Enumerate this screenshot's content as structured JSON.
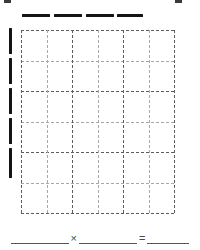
{
  "page": {
    "background_color": "#ffffff",
    "width": 200,
    "height": 250
  },
  "crop_marks": {
    "name": "page-crop-marks",
    "color": "#3a3a3a",
    "marks": [
      {
        "id": "top-left",
        "x": 4,
        "y": 0,
        "w": 7,
        "h": 3
      },
      {
        "id": "top-right",
        "x": 175,
        "y": 0,
        "w": 7,
        "h": 3
      }
    ]
  },
  "column_markers": {
    "name": "column-bars",
    "color": "#141414",
    "count": 4,
    "bar_height": 3,
    "y": 14,
    "bars": [
      {
        "id": "col-bar-1",
        "x": 22,
        "w": 28
      },
      {
        "id": "col-bar-2",
        "x": 54,
        "w": 28
      },
      {
        "id": "col-bar-3",
        "x": 86,
        "w": 28
      },
      {
        "id": "col-bar-4",
        "x": 117,
        "w": 26
      }
    ]
  },
  "row_markers": {
    "name": "row-bars",
    "color": "#141414",
    "count": 5,
    "bar_width": 3,
    "x": 9,
    "bars": [
      {
        "id": "row-bar-1",
        "y": 28,
        "h": 26
      },
      {
        "id": "row-bar-2",
        "y": 58,
        "h": 26
      },
      {
        "id": "row-bar-3",
        "y": 88,
        "h": 26
      },
      {
        "id": "row-bar-4",
        "y": 118,
        "h": 26
      },
      {
        "id": "row-bar-5",
        "y": 148,
        "h": 30
      }
    ]
  },
  "grid": {
    "name": "dashed-array-grid",
    "x": 21,
    "y": 30,
    "width": 153,
    "height": 183,
    "columns": 6,
    "rows": 6,
    "minor_color": "#a8a8a8",
    "major_color": "#5c5c5c",
    "dash_style": "dashed"
  },
  "equation": {
    "name": "multiplication-equation",
    "y": 232,
    "multiply_symbol": "×",
    "equals_symbol": "=",
    "blanks": [
      {
        "id": "factor-1-blank",
        "value": "",
        "width": 58
      },
      {
        "id": "factor-2-blank",
        "value": "",
        "width": 58
      },
      {
        "id": "product-blank",
        "value": "",
        "width": 42
      }
    ]
  }
}
